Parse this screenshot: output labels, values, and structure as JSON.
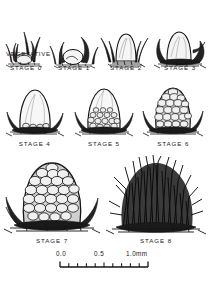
{
  "figure": {
    "vegetative_label": "VEGETATIVE",
    "ink_color": "#151515",
    "background_color": "#ffffff"
  },
  "rows": [
    {
      "row_index": 1,
      "stages": [
        {
          "id": "stage-0",
          "label": "STAGE 0",
          "form": "small bud with leaf blades"
        },
        {
          "id": "stage-1",
          "label": "STAGE 1",
          "form": "low dome partly enclosed by leaves"
        },
        {
          "id": "stage-2",
          "label": "STAGE 2",
          "form": "smooth elongating dome with grass at base"
        },
        {
          "id": "stage-3",
          "label": "STAGE 3",
          "form": "dome emerging above bracts"
        }
      ]
    },
    {
      "row_index": 2,
      "stages": [
        {
          "id": "stage-4",
          "label": "STAGE 4",
          "form": "smooth tall dome, basal bumps"
        },
        {
          "id": "stage-5",
          "label": "STAGE 5",
          "form": "dome with lower half covered in round primordia"
        },
        {
          "id": "stage-6",
          "label": "STAGE 6",
          "form": "dome fully covered in round primordia"
        }
      ]
    },
    {
      "row_index": 3,
      "stages": [
        {
          "id": "stage-7",
          "label": "STAGE 7",
          "form": "knobby cone of enlarged florets"
        },
        {
          "id": "stage-8",
          "label": "STAGE 8",
          "form": "dense mass of emerging bristles/awns"
        }
      ]
    }
  ],
  "scale_bar": {
    "unit": "mm",
    "ticks": [
      "0.0",
      "0.5",
      "1.0mm"
    ],
    "tick_values": [
      0.0,
      0.5,
      1.0
    ],
    "minor_divisions": 10,
    "length_mm": 1.0
  }
}
